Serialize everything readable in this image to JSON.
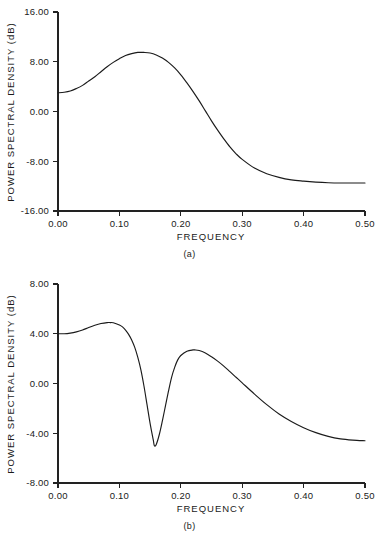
{
  "chart_data": [
    {
      "type": "line",
      "panel_label": "(a)",
      "title": "",
      "xlabel": "FREQUENCY",
      "ylabel": "POWER SPECTRAL DENSITY (dB)",
      "xlim": [
        0.0,
        0.5
      ],
      "ylim": [
        -16.0,
        16.0
      ],
      "grid": false,
      "legend": "none",
      "xticks": [
        "0.00",
        "0.10",
        "0.20",
        "0.30",
        "0.40",
        "0.50"
      ],
      "xtick_values": [
        0.0,
        0.1,
        0.2,
        0.3,
        0.4,
        0.5
      ],
      "yticks": [
        "16.00",
        "8.00",
        "0.00",
        "-8.00",
        "-16.00"
      ],
      "ytick_values": [
        16.0,
        8.0,
        0.0,
        -8.0,
        -16.0
      ],
      "series": [
        {
          "name": "power spectral density",
          "x": [
            0.0,
            0.01,
            0.02,
            0.03,
            0.04,
            0.05,
            0.06,
            0.07,
            0.08,
            0.09,
            0.1,
            0.11,
            0.12,
            0.13,
            0.135,
            0.14,
            0.15,
            0.16,
            0.17,
            0.18,
            0.19,
            0.2,
            0.21,
            0.22,
            0.23,
            0.24,
            0.25,
            0.26,
            0.27,
            0.28,
            0.29,
            0.3,
            0.32,
            0.34,
            0.36,
            0.38,
            0.4,
            0.42,
            0.44,
            0.46,
            0.48,
            0.5
          ],
          "y": [
            3.0,
            3.1,
            3.3,
            3.7,
            4.2,
            4.9,
            5.6,
            6.4,
            7.2,
            7.9,
            8.5,
            9.0,
            9.3,
            9.5,
            9.5,
            9.5,
            9.4,
            9.1,
            8.6,
            7.9,
            7.0,
            5.9,
            4.6,
            3.2,
            1.7,
            0.1,
            -1.5,
            -3.0,
            -4.4,
            -5.7,
            -6.8,
            -7.7,
            -9.1,
            -10.0,
            -10.6,
            -11.0,
            -11.2,
            -11.35,
            -11.45,
            -11.5,
            -11.5,
            -11.5
          ]
        }
      ]
    },
    {
      "type": "line",
      "panel_label": "(b)",
      "title": "",
      "xlabel": "FREQUENCY",
      "ylabel": "POWER SPECTRAL DENSITY (dB)",
      "xlim": [
        0.0,
        0.5
      ],
      "ylim": [
        -8.0,
        8.0
      ],
      "grid": false,
      "legend": "none",
      "xticks": [
        "0.00",
        "0.10",
        "0.20",
        "0.30",
        "0.40",
        "0.50"
      ],
      "xtick_values": [
        0.0,
        0.1,
        0.2,
        0.3,
        0.4,
        0.5
      ],
      "yticks": [
        "8.00",
        "4.00",
        "0.00",
        "-4.00",
        "-8.00"
      ],
      "ytick_values": [
        8.0,
        4.0,
        0.0,
        -4.0,
        -8.0
      ],
      "series": [
        {
          "name": "power spectral density",
          "x": [
            0.0,
            0.01,
            0.02,
            0.03,
            0.04,
            0.05,
            0.06,
            0.07,
            0.08,
            0.085,
            0.09,
            0.1,
            0.105,
            0.11,
            0.115,
            0.12,
            0.125,
            0.13,
            0.135,
            0.14,
            0.145,
            0.15,
            0.155,
            0.157,
            0.16,
            0.165,
            0.17,
            0.175,
            0.18,
            0.185,
            0.19,
            0.195,
            0.2,
            0.21,
            0.22,
            0.223,
            0.23,
            0.24,
            0.25,
            0.26,
            0.27,
            0.28,
            0.29,
            0.3,
            0.32,
            0.34,
            0.36,
            0.38,
            0.4,
            0.42,
            0.44,
            0.46,
            0.48,
            0.5
          ],
          "y": [
            4.0,
            4.0,
            4.05,
            4.15,
            4.3,
            4.5,
            4.68,
            4.82,
            4.9,
            4.9,
            4.88,
            4.7,
            4.55,
            4.3,
            3.95,
            3.5,
            2.9,
            2.1,
            1.1,
            -0.2,
            -1.7,
            -3.2,
            -4.5,
            -5.0,
            -4.9,
            -4.1,
            -3.0,
            -1.8,
            -0.6,
            0.5,
            1.3,
            1.9,
            2.25,
            2.6,
            2.7,
            2.7,
            2.65,
            2.45,
            2.15,
            1.8,
            1.4,
            0.95,
            0.5,
            0.05,
            -0.85,
            -1.7,
            -2.45,
            -3.05,
            -3.55,
            -3.95,
            -4.25,
            -4.45,
            -4.55,
            -4.6
          ]
        }
      ]
    }
  ],
  "figures": {
    "a": {
      "caption": "(a)",
      "xlabel": "FREQUENCY",
      "ylabel": "POWER SPECTRAL DENSITY (dB)"
    },
    "b": {
      "caption": "(b)",
      "xlabel": "FREQUENCY",
      "ylabel": "POWER SPECTRAL DENSITY (dB)"
    }
  }
}
